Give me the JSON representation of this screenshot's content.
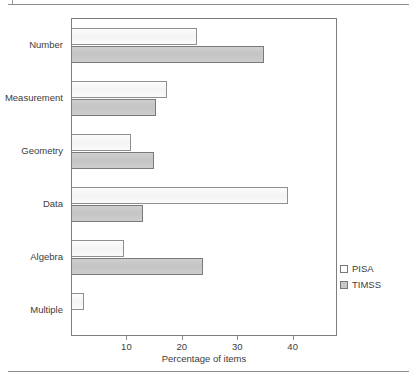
{
  "figure": {
    "has_top_rule": true,
    "has_bottom_rule": true
  },
  "legend": {
    "position": "inside-right-lower",
    "entries": [
      {
        "label": "PISA",
        "swatch": "white-square-icon",
        "color": "#ffffff"
      },
      {
        "label": "TIMSS",
        "swatch": "gray-square-icon",
        "color": "#c8c8c8"
      }
    ]
  },
  "axis": {
    "x_title": "Percentage of items",
    "x_ticks": [
      "10",
      "20",
      "30",
      "40"
    ]
  },
  "chart_data": {
    "type": "bar",
    "orientation": "horizontal",
    "title": "",
    "xlabel": "Percentage of items",
    "ylabel": "",
    "xlim": [
      0,
      48
    ],
    "grid": false,
    "legend_position": "inside-right-lower",
    "xticks": [
      10,
      20,
      30,
      40
    ],
    "categories": [
      "Number",
      "Measurement",
      "Geometry",
      "Data",
      "Algebra",
      "Multiple"
    ],
    "series": [
      {
        "name": "PISA",
        "values": [
          22.5,
          17.1,
          10.6,
          39.0,
          9.4,
          2.2
        ]
      },
      {
        "name": "TIMSS",
        "values": [
          34.7,
          15.1,
          14.8,
          12.9,
          23.6,
          0.0
        ]
      }
    ]
  }
}
